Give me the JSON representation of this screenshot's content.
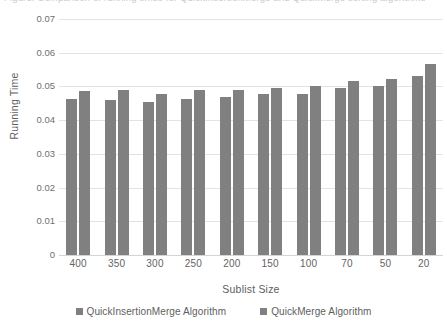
{
  "clipped_title": "Figure: Comparison of running times for QuickInsertionMerge and QuickMerge sorting algorithms",
  "axes": {
    "y_title": "Running Time",
    "x_title": "Sublist Size",
    "y_ticks": [
      "0.07",
      "0.06",
      "0.05",
      "0.04",
      "0.03",
      "0.02",
      "0.01",
      "0"
    ]
  },
  "legend": {
    "items": [
      {
        "label": "QuickInsertionMerge Algorithm",
        "color": "#808080",
        "marker": "square-marker"
      },
      {
        "label": "QuickMerge Algorithm",
        "color": "#808080",
        "marker": "square-marker"
      }
    ]
  },
  "colors": {
    "bar": "#808080",
    "gridline": "#e3e3e3",
    "text": "#5e5e5e",
    "background": "#ffffff"
  },
  "chart_data": {
    "type": "bar",
    "title": "",
    "xlabel": "Sublist Size",
    "ylabel": "Running Time",
    "categories": [
      "400",
      "350",
      "300",
      "250",
      "200",
      "150",
      "100",
      "70",
      "50",
      "20"
    ],
    "series": [
      {
        "name": "QuickInsertionMerge Algorithm",
        "color": "#808080",
        "values": [
          0.0464,
          0.0459,
          0.0455,
          0.0462,
          0.0469,
          0.0478,
          0.0479,
          0.0495,
          0.0501,
          0.0532
        ]
      },
      {
        "name": "QuickMerge Algorithm",
        "color": "#808080",
        "values": [
          0.0485,
          0.0489,
          0.0477,
          0.049,
          0.0488,
          0.0496,
          0.0502,
          0.0516,
          0.0523,
          0.0566
        ]
      }
    ],
    "ylim": [
      0,
      0.07
    ],
    "ytick_step": 0.01,
    "grid": true,
    "legend_position": "bottom"
  }
}
